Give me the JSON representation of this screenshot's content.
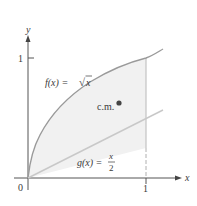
{
  "diagram": {
    "axes": {
      "x_label": "x",
      "y_label": "y",
      "origin_label": "0",
      "x_tick_label": "1",
      "y_tick_label": "1"
    },
    "curves": [
      {
        "name": "f",
        "label": "f(x) = √x",
        "label_left": "f(x) = ",
        "label_right": "x",
        "expression": "sqrt(x)",
        "color": "#9a9a9a"
      },
      {
        "name": "g",
        "label": "g(x) = x/2",
        "label_left": "g(x) = ",
        "numerator": "x",
        "denominator": "2",
        "expression": "x/2",
        "color": "#c8c8c8"
      }
    ],
    "region": {
      "from_x": 0,
      "to_x": 1,
      "fill": "#f2f2f2"
    },
    "center_of_mass": {
      "label": "c.m.",
      "color": "#444444"
    },
    "colors": {
      "axis": "#555555",
      "dashed_line": "#b0b0b0"
    }
  }
}
